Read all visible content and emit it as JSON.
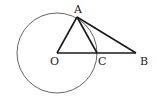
{
  "diagram": {
    "type": "geometry",
    "circle": {
      "center": "O",
      "cx": 57,
      "cy": 53,
      "r": 40,
      "stroke": "#555555"
    },
    "points": {
      "A": {
        "label": "A",
        "x": 77,
        "y": 18
      },
      "O": {
        "label": "O",
        "x": 57,
        "y": 53
      },
      "C": {
        "label": "C",
        "x": 97,
        "y": 53
      },
      "B": {
        "label": "B",
        "x": 136,
        "y": 53
      }
    },
    "segments": [
      "OA",
      "AC",
      "AB",
      "OB"
    ],
    "line_color": "#1a1a1a"
  }
}
